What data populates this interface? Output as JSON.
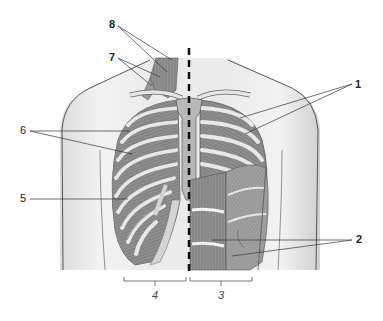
{
  "figure": {
    "colors": {
      "background": "#ffffff",
      "skin": "#ececec",
      "skin_outline": "#555555",
      "bone": "#d4d4d4",
      "bone_light": "#e6e6e6",
      "muscle": "#8e8e8e",
      "muscle_dark": "#7a7a7a",
      "line": "#333333",
      "midline_dash": "#111111"
    },
    "labels": [
      {
        "id": "8",
        "text": "8",
        "bold": true,
        "x": 109,
        "y": 19
      },
      {
        "id": "7",
        "text": "7",
        "bold": true,
        "x": 109,
        "y": 52
      },
      {
        "id": "6",
        "text": "6",
        "bold": false,
        "x": 20,
        "y": 125
      },
      {
        "id": "5",
        "text": "5",
        "bold": false,
        "x": 20,
        "y": 193
      },
      {
        "id": "1",
        "text": "1",
        "bold": true,
        "x": 355,
        "y": 80
      },
      {
        "id": "2",
        "text": "2",
        "bold": true,
        "x": 356,
        "y": 235
      }
    ],
    "brackets": [
      {
        "id": "4",
        "text": "4",
        "x1": 124,
        "x2": 186,
        "label_x": 155,
        "label_y": 295
      },
      {
        "id": "3",
        "text": "3",
        "x1": 190,
        "x2": 252,
        "label_x": 221,
        "label_y": 295
      }
    ],
    "midline": {
      "x": 189,
      "y1": 48,
      "y2": 272,
      "style": "dashed"
    }
  }
}
